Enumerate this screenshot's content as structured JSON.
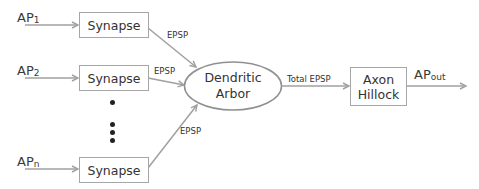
{
  "diagram": {
    "inputs": [
      {
        "base": "AP",
        "sub": "1"
      },
      {
        "base": "AP",
        "sub": "2"
      },
      {
        "base": "AP",
        "sub": "n"
      }
    ],
    "synapse_label": "Synapse",
    "edge_label": "EPSP",
    "dendritic": {
      "line1": "Dendritic",
      "line2": "Arbor"
    },
    "total_label": "Total EPSP",
    "axon": {
      "line1": "Axon",
      "line2": "Hillock"
    },
    "output": {
      "base": "AP",
      "sub": "out"
    },
    "colors": {
      "line": "#a0a0a0",
      "border": "#a6a6a6",
      "text": "#333333",
      "dots": "#222222"
    }
  }
}
